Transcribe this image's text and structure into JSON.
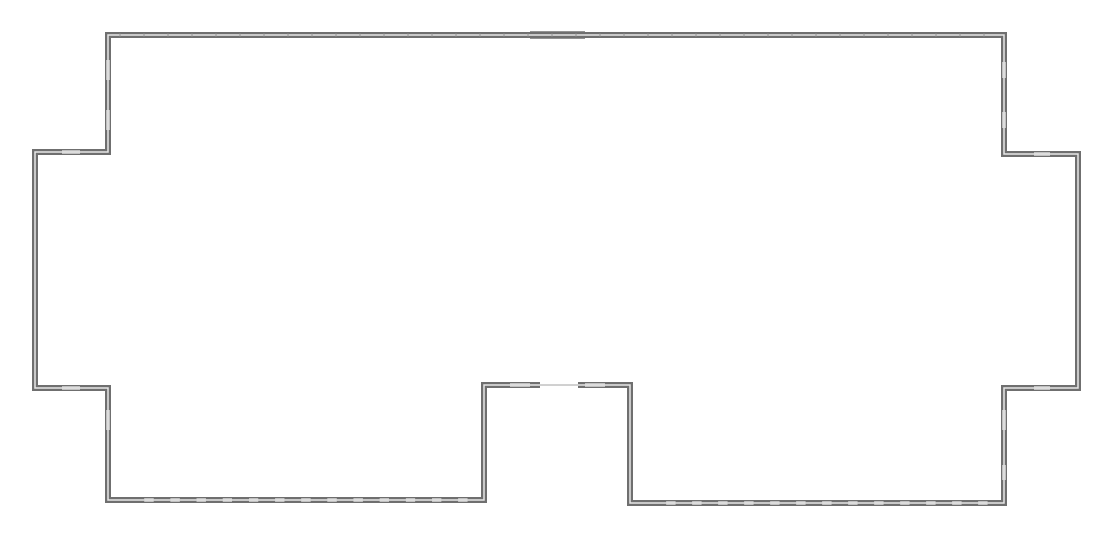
{
  "diagram": {
    "type": "floor-plan-outline",
    "colors": {
      "background": "#ffffff",
      "wall_outer": "#6f6f6f",
      "wall_inner": "#e8e8e8",
      "window": "#f4f4f4",
      "window_line": "#8a8a8a"
    },
    "wall_path": [
      [
        108,
        35
      ],
      [
        1004,
        35
      ],
      [
        1004,
        154
      ],
      [
        1078,
        154
      ],
      [
        1078,
        388
      ],
      [
        1004,
        388
      ],
      [
        1004,
        503
      ],
      [
        630,
        503
      ],
      [
        630,
        385
      ],
      [
        484,
        385
      ],
      [
        484,
        500
      ],
      [
        108,
        500
      ],
      [
        108,
        388
      ],
      [
        35,
        388
      ],
      [
        35,
        152
      ],
      [
        108,
        152
      ]
    ],
    "windows": [
      {
        "x1": 530,
        "y1": 32,
        "x2": 585,
        "y2": 32,
        "label": "top-double-window"
      },
      {
        "x1": 530,
        "y1": 38,
        "x2": 585,
        "y2": 38,
        "label": "top-double-window"
      },
      {
        "x1": 108,
        "y1": 60,
        "x2": 108,
        "y2": 80,
        "label": "left-upper-window"
      },
      {
        "x1": 108,
        "y1": 110,
        "x2": 108,
        "y2": 130,
        "label": "left-upper-window"
      },
      {
        "x1": 62,
        "y1": 152,
        "x2": 80,
        "y2": 152,
        "label": "left-window"
      },
      {
        "x1": 62,
        "y1": 388,
        "x2": 80,
        "y2": 388,
        "label": "left-window"
      },
      {
        "x1": 108,
        "y1": 410,
        "x2": 108,
        "y2": 430,
        "label": "left-lower-window"
      },
      {
        "x1": 1004,
        "y1": 62,
        "x2": 1004,
        "y2": 78,
        "label": "right-upper-window"
      },
      {
        "x1": 1004,
        "y1": 112,
        "x2": 1004,
        "y2": 128,
        "label": "right-upper-window"
      },
      {
        "x1": 1034,
        "y1": 154,
        "x2": 1050,
        "y2": 154,
        "label": "right-window"
      },
      {
        "x1": 1034,
        "y1": 388,
        "x2": 1050,
        "y2": 388,
        "label": "right-window"
      },
      {
        "x1": 1004,
        "y1": 410,
        "x2": 1004,
        "y2": 430,
        "label": "right-lower-window"
      },
      {
        "x1": 1004,
        "y1": 465,
        "x2": 1004,
        "y2": 480,
        "label": "right-lower-window"
      },
      {
        "x1": 510,
        "y1": 385,
        "x2": 530,
        "y2": 385,
        "label": "notch-window"
      },
      {
        "x1": 585,
        "y1": 385,
        "x2": 605,
        "y2": 385,
        "label": "notch-window"
      }
    ],
    "door": {
      "x1": 540,
      "y1": 385,
      "x2": 578,
      "y2": 385,
      "label": "entry-opening"
    },
    "bottom_window_rows": [
      {
        "y": 500,
        "x_start": 130,
        "x_end": 470,
        "count": 13
      },
      {
        "y": 503,
        "x_start": 652,
        "x_end": 990,
        "count": 13
      }
    ],
    "top_ticks": {
      "y": 35,
      "x_start": 120,
      "x_end": 1000,
      "spacing": 24
    }
  }
}
